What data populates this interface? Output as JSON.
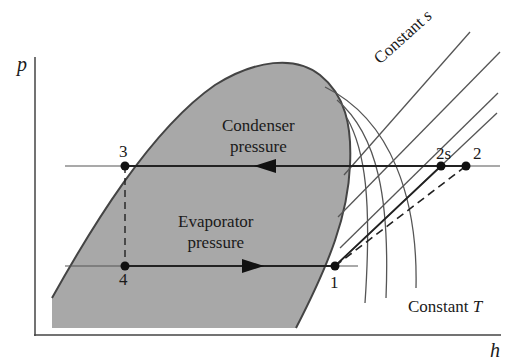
{
  "diagram": {
    "type": "p-h diagram (vapor-compression refrigeration cycle)",
    "axes": {
      "y_label": "p",
      "x_label": "h"
    },
    "regions": {
      "condenser": {
        "line1": "Condenser",
        "line2": "pressure"
      },
      "evaporator": {
        "line1": "Evaporator",
        "line2": "pressure"
      }
    },
    "points": [
      {
        "id": "1",
        "label": "1"
      },
      {
        "id": "2",
        "label": "2"
      },
      {
        "id": "2s",
        "label": "2s"
      },
      {
        "id": "3",
        "label": "3"
      },
      {
        "id": "4",
        "label": "4"
      }
    ],
    "annotations": {
      "constant_s": {
        "text": "Constant ",
        "italic": "s"
      },
      "constant_T": {
        "text": "Constant ",
        "italic": "T"
      }
    },
    "colors": {
      "dome_fill": "#a8a8a8",
      "line": "#333333",
      "thin_line": "#555555",
      "background": "#ffffff"
    },
    "processes": [
      {
        "from": "1",
        "to": "2s",
        "style": "solid",
        "meaning": "isentropic compression"
      },
      {
        "from": "1",
        "to": "2",
        "style": "dashed",
        "meaning": "actual compression"
      },
      {
        "from": "2",
        "to": "3",
        "style": "solid",
        "direction": "left",
        "meaning": "condenser pressure"
      },
      {
        "from": "3",
        "to": "4",
        "style": "dashed",
        "meaning": "throttling"
      },
      {
        "from": "4",
        "to": "1",
        "style": "solid",
        "direction": "right",
        "meaning": "evaporator pressure"
      }
    ]
  }
}
